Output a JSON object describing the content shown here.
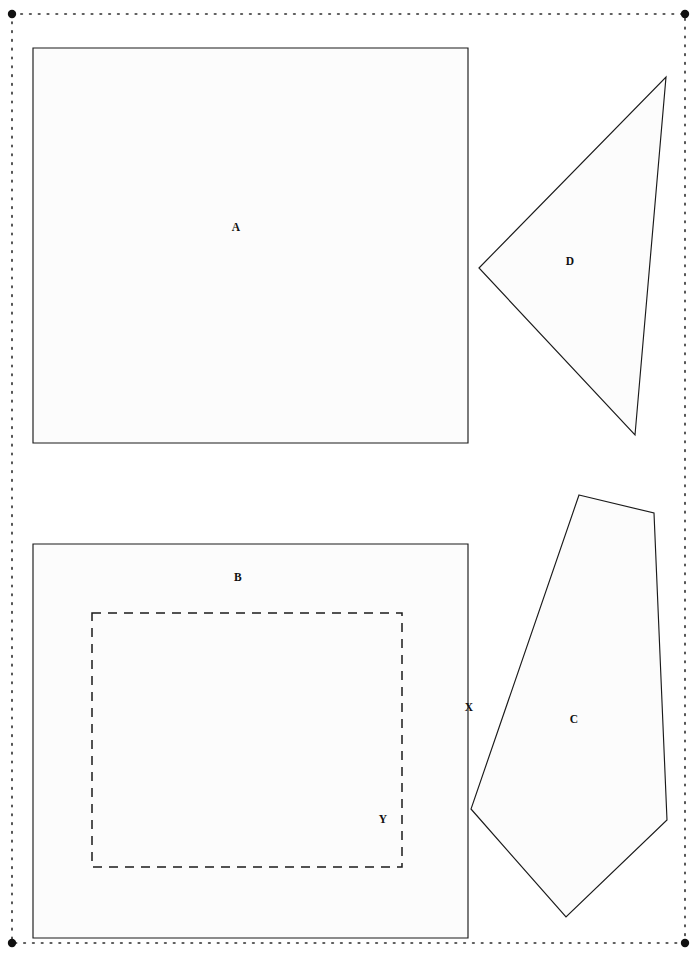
{
  "page": {
    "width": 697,
    "height": 958,
    "background_color": "#ffffff",
    "ink_color": "#1a1a1a",
    "shape_fill_color": "#fcfcfc"
  },
  "frame": {
    "name": "dotted-page-border",
    "style": "dotted",
    "x": 12,
    "y": 14,
    "width": 673,
    "height": 929,
    "stroke_color": "#2b2b2b",
    "corner_markers": [
      {
        "label": "top-left",
        "cx": 12,
        "cy": 14,
        "r": 4.2
      },
      {
        "label": "top-right",
        "cx": 685,
        "cy": 14,
        "r": 4.2
      },
      {
        "label": "bottom-left",
        "cx": 12,
        "cy": 943,
        "r": 4.2
      },
      {
        "label": "bottom-right",
        "cx": 685,
        "cy": 943,
        "r": 4.2
      }
    ]
  },
  "shapes": [
    {
      "id": "A",
      "name": "rectangle-a",
      "type": "rectangle",
      "label": "A",
      "label_x": 236,
      "label_y": 228,
      "points": "33,48 468,48 468,443 33,443",
      "line_style": "solid"
    },
    {
      "id": "B",
      "name": "rectangle-b",
      "type": "rectangle",
      "label": "B",
      "label_x": 238,
      "label_y": 578,
      "points": "33,544 468,544 468,938 33,938",
      "line_style": "solid"
    },
    {
      "id": "C",
      "name": "pentagon-c",
      "type": "pentagon",
      "label": "C",
      "label_x": 574,
      "label_y": 720,
      "points": "579,495 654,513 667,820 566,917 471,809",
      "line_style": "solid"
    },
    {
      "id": "D",
      "name": "triangle-d",
      "type": "triangle",
      "label": "D",
      "label_x": 570,
      "label_y": 262,
      "points": "479,268 666,77 635,435",
      "line_style": "solid"
    }
  ],
  "dashed_region": {
    "id": "Y",
    "name": "dashed-inner-rectangle",
    "type": "rectangle",
    "line_style": "dashed",
    "points": "92,613 402,613 402,867 92,867",
    "label": "Y",
    "label_x": 383,
    "label_y": 820
  },
  "edge_labels": [
    {
      "id": "X",
      "name": "edge-label-x",
      "label": "X",
      "label_x": 469,
      "label_y": 708,
      "describes": "right edge of rectangle B"
    }
  ]
}
